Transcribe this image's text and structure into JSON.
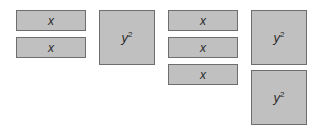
{
  "groups": [
    {
      "x_tiles": [
        {
          "label": "x",
          "left": 16,
          "top": 10
        },
        {
          "label": "x",
          "left": 16,
          "top": 37
        }
      ],
      "y2_tiles": [
        {
          "base": "y",
          "exp": "2",
          "left": 99,
          "top": 10
        }
      ]
    },
    {
      "x_tiles": [
        {
          "label": "x",
          "left": 168,
          "top": 10
        },
        {
          "label": "x",
          "left": 168,
          "top": 37
        },
        {
          "label": "x",
          "left": 168,
          "top": 64
        }
      ],
      "y2_tiles": [
        {
          "base": "y",
          "exp": "2",
          "left": 251,
          "top": 10
        },
        {
          "base": "y",
          "exp": "2",
          "left": 251,
          "top": 70
        }
      ]
    }
  ]
}
